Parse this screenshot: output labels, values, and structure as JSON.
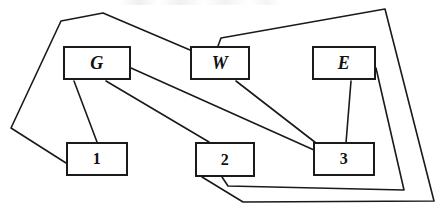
{
  "diagram": {
    "type": "node-link-graph",
    "background_color": "#ffffff",
    "line_color": "#1a1a1a",
    "canvas": {
      "width": 444,
      "height": 220
    },
    "nodes": [
      {
        "id": "G",
        "label": "G",
        "style": "italic-letter",
        "x": 63,
        "y": 46,
        "w": 68,
        "h": 34
      },
      {
        "id": "W",
        "label": "W",
        "style": "italic-letter",
        "x": 190,
        "y": 46,
        "w": 60,
        "h": 34
      },
      {
        "id": "E",
        "label": "E",
        "style": "italic-letter",
        "x": 312,
        "y": 46,
        "w": 64,
        "h": 34
      },
      {
        "id": "1",
        "label": "1",
        "style": "numeral",
        "x": 66,
        "y": 142,
        "w": 62,
        "h": 34
      },
      {
        "id": "2",
        "label": "2",
        "style": "numeral",
        "x": 195,
        "y": 142,
        "w": 60,
        "h": 35
      },
      {
        "id": "3",
        "label": "3",
        "style": "numeral",
        "x": 313,
        "y": 142,
        "w": 62,
        "h": 34
      }
    ],
    "edges": [
      {
        "id": "edge-G-1",
        "from": "G",
        "to": "1",
        "points": "74,81 97,142"
      },
      {
        "id": "edge-G-2",
        "from": "G",
        "to": "2",
        "points": "106,81 209,142"
      },
      {
        "id": "edge-G-3",
        "from": "G",
        "to": "3",
        "points": "131,68 314,150"
      },
      {
        "id": "edge-W-3",
        "from": "W",
        "to": "3",
        "points": "236,81 316,143"
      },
      {
        "id": "edge-E-3",
        "from": "E",
        "to": "3",
        "points": "351,81 346,143"
      },
      {
        "id": "edge-1-W",
        "from": "1",
        "to": "W",
        "points": "66,163 11,128 61,21 103,13 190,50"
      },
      {
        "id": "edge-W-E-right",
        "from": "W",
        "to": "2",
        "points": "218,46 221,38 385,9 434,201 243,202"
      },
      {
        "id": "edge-2-outer",
        "from": "2",
        "to": "right-lower",
        "points": "202,177 243,202"
      },
      {
        "id": "edge-2-inner",
        "from": "2",
        "to": "E",
        "points": "222,177 228,186 404,190 376,68"
      }
    ],
    "edge_polylines": [
      "66,163 11,128 61,21 103,13 190,50",
      "218,46 221,38 385,9 434,201 243,202 202,177",
      "222,177 228,186 404,190 376,68",
      "74,81 97,142",
      "106,81 209,142",
      "131,68 314,150",
      "236,81 316,143",
      "351,81 346,143"
    ]
  }
}
